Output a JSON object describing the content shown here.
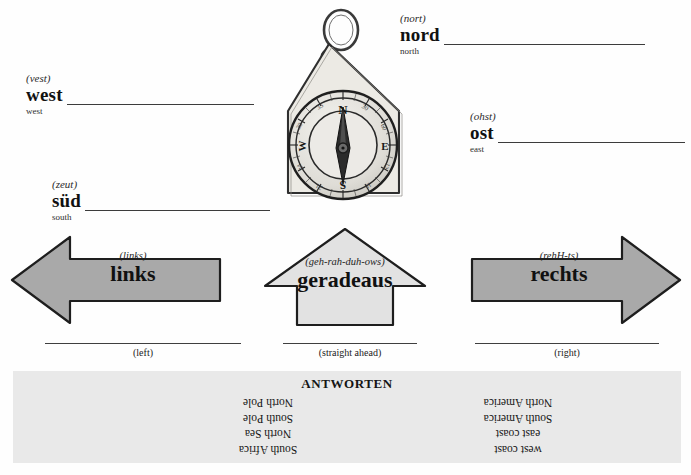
{
  "directions": [
    {
      "id": "west",
      "pronunciation": "(vest)",
      "german": "west",
      "english": "west"
    },
    {
      "id": "nord",
      "pronunciation": "(nort)",
      "german": "nord",
      "english": "north"
    },
    {
      "id": "sued",
      "pronunciation": "(zeut)",
      "german": "süd",
      "english": "south"
    },
    {
      "id": "ost",
      "pronunciation": "(ohst)",
      "german": "ost",
      "english": "east"
    }
  ],
  "arrows": [
    {
      "id": "links",
      "pronunciation": "(links)",
      "german": "links",
      "english": "(left)",
      "direction": "left",
      "fill": "#a9a9a9"
    },
    {
      "id": "geradeaus",
      "pronunciation": "(geh-rah-duh-ows)",
      "german": "geradeaus",
      "english": "(straight ahead)",
      "direction": "up",
      "fill": "#e2e2e2"
    },
    {
      "id": "rechts",
      "pronunciation": "(rehH-ts)",
      "german": "rechts",
      "english": "(right)",
      "direction": "right",
      "fill": "#a9a9a9"
    }
  ],
  "compass": {
    "icon": "compass-pendant-icon",
    "cardinal_labels": [
      "N",
      "E",
      "S",
      "W"
    ],
    "degree_labels": [
      "0",
      "30",
      "60",
      "90",
      "120",
      "150",
      "180",
      "210",
      "240",
      "270",
      "300",
      "330"
    ]
  },
  "answers": {
    "title": "ANTWORTEN",
    "left_column": [
      "North Pole",
      "South Pole",
      "North Sea",
      "South Africa"
    ],
    "right_column": [
      "North America",
      "South America",
      "east coast",
      "west coast"
    ]
  },
  "colors": {
    "arrow_dark": "#a9a9a9",
    "arrow_light": "#e2e2e2",
    "answer_panel": "#e9e9e9",
    "rule": "#3c3c3c"
  }
}
